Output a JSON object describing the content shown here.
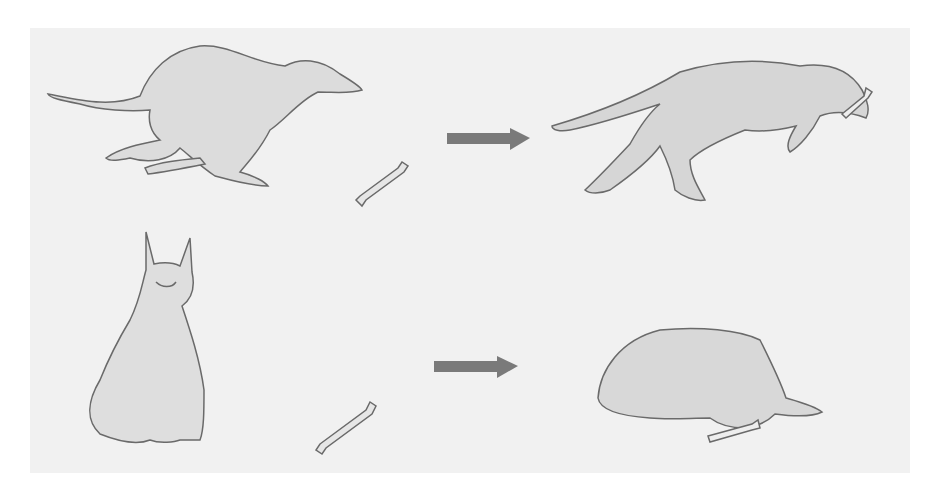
{
  "image": {
    "description": "Pencil drawing comparing two dogs: top row a running greyhound-like dog and a bone, arrow to an emaciated dog carrying the bone; bottom row a sitting shepherd dog and a bone, arrow to the dog lying down with the bone in its mouth.",
    "colors": {
      "paper": "#f1f1f1",
      "pencil": "#6a6a6a",
      "fill": "#d9d9d9",
      "arrow": "#777777"
    },
    "rows": [
      {
        "left": "running-lean-dog",
        "object": "bone",
        "arrow": "right-arrow",
        "right": "thin-dog-carrying-bone"
      },
      {
        "left": "sitting-shepherd-dog",
        "object": "bone",
        "arrow": "right-arrow",
        "right": "lying-dog-with-bone"
      }
    ]
  }
}
